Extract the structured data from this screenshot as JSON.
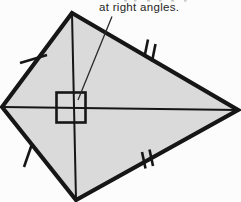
{
  "diagram": {
    "type": "kite",
    "annotation": "at right angles.",
    "elements": {
      "shape": "kite quadrilateral with two diagonals",
      "right_angle_marker": "square at diagonal intersection",
      "leader_line": "from annotation text to right-angle marker",
      "equal_side_marks": {
        "single_ticks": [
          "upper-left side",
          "lower-left side"
        ],
        "double_ticks": [
          "upper-right side",
          "lower-right side"
        ]
      }
    },
    "colors": {
      "shape_fill": "#dadada",
      "line": "#161616",
      "text": "#262626",
      "background": "#fcfcfc"
    }
  }
}
